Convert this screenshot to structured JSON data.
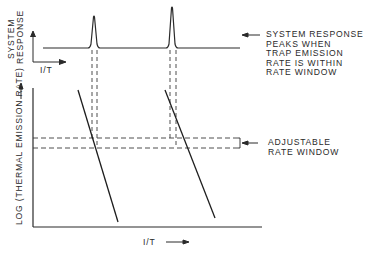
{
  "figure": {
    "top_plot": {
      "y_label_line1": "SYSTEM",
      "y_label_line2": "RESPONSE",
      "x_label": "I/T",
      "peaks": [
        {
          "x": 94,
          "top_y": 16
        },
        {
          "x": 172,
          "top_y": 7
        }
      ]
    },
    "bottom_plot": {
      "y_label": "LOG (THERMAL EMISSION RATE)",
      "x_label": "I/T"
    },
    "annotations": {
      "peak_note": {
        "lines": [
          "SYSTEM RESPONSE",
          "PEAKS WHEN",
          "TRAP EMISSION",
          "RATE IS WITHIN",
          "RATE WINDOW"
        ]
      },
      "window_note": {
        "lines": [
          "ADJUSTABLE",
          "RATE WINDOW"
        ]
      }
    },
    "colors": {
      "ink": "#2a2a2a",
      "background": "#ffffff"
    }
  }
}
